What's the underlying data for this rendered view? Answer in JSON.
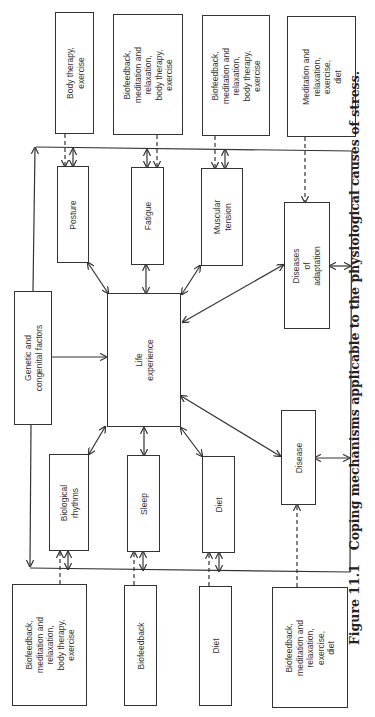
{
  "diagram": {
    "top_coping": [
      {
        "label": "Body therapy,\nexercise"
      },
      {
        "label": "Biofeedback,\nmeditation and\nrelaxation,\nbody therapy,\nexercise"
      },
      {
        "label": "Biofeedback,\nmeditation and\nrelaxation,\nbody therapy,\nexercise"
      },
      {
        "label": "Meditation and\nrelaxation,\nexercise,\ndiet"
      }
    ],
    "top_causes": [
      {
        "label": "Posture"
      },
      {
        "label": "Fatigue"
      },
      {
        "label": "Muscular\ntension"
      }
    ],
    "diseases_of_adaptation": "Diseases\nof\nadaptation",
    "genetic": "Genetic and\ncongenital factors",
    "life_experience": "Life\nexperience",
    "disease": "Disease",
    "bottom_causes": [
      {
        "label": "Biological\nrhythms"
      },
      {
        "label": "Sleep"
      },
      {
        "label": "Diet"
      }
    ],
    "bottom_coping": [
      {
        "label": "Biofeedback,\nmeditation and\nrelaxation,\nbody therapy,\nexercise"
      },
      {
        "label": "Biofeedback"
      },
      {
        "label": "Diet"
      },
      {
        "label": "Biofeedback,\nmeditation and\nrelaxation,\nexercise,\ndiet"
      }
    ]
  },
  "caption": {
    "number": "Figure 11.1",
    "text": "Coping mechanisms applicable to the physiological causes of stress."
  }
}
